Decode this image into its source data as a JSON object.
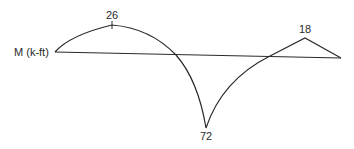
{
  "diagram": {
    "type": "bending-moment-diagram",
    "axis_label": "M (k-ft)",
    "line_color": "#2a2a2a",
    "values": [
      {
        "name": "positive-peak-left",
        "label": "26",
        "sign": "positive"
      },
      {
        "name": "negative-peak",
        "label": "72",
        "sign": "negative"
      },
      {
        "name": "positive-peak-right",
        "label": "18",
        "sign": "positive"
      }
    ]
  }
}
